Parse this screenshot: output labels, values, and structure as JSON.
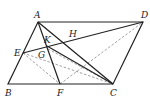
{
  "figure": {
    "type": "geometry",
    "shape": "parallelogram ABCD",
    "points": [
      {
        "label": "A",
        "x": 38,
        "y": 22
      },
      {
        "label": "D",
        "x": 143,
        "y": 22
      },
      {
        "label": "B",
        "x": 8,
        "y": 84
      },
      {
        "label": "C",
        "x": 113,
        "y": 84
      },
      {
        "label": "F",
        "x": 60,
        "y": 84
      },
      {
        "label": "E",
        "x": 23,
        "y": 53
      },
      {
        "label": "G",
        "x": 48,
        "y": 49
      },
      {
        "label": "K",
        "x": 47,
        "y": 46
      },
      {
        "label": "H",
        "x": 72,
        "y": 41
      }
    ],
    "labels": {
      "A": "A",
      "D": "D",
      "B": "B",
      "C": "C",
      "F": "F",
      "E": "E",
      "G": "G",
      "K": "K",
      "H": "H"
    },
    "solid_segments": [
      "AD",
      "DC",
      "CB",
      "BA",
      "AF",
      "AC",
      "ED",
      "KC"
    ],
    "dashed_segments": [
      "AC",
      "EC",
      "EF",
      "FD",
      "GC"
    ]
  }
}
